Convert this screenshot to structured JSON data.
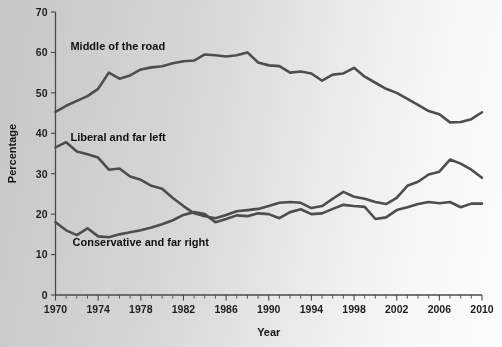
{
  "chart_data": {
    "type": "line",
    "title": "",
    "xlabel": "Year",
    "ylabel": "Percentage",
    "xlim": [
      1970,
      2010
    ],
    "ylim": [
      0,
      70
    ],
    "grid": false,
    "legend_position": "inline-annotations",
    "x_ticks_major": [
      1970,
      1974,
      1978,
      1982,
      1986,
      1990,
      1994,
      1998,
      2002,
      2006,
      2010
    ],
    "x_tick_labels": [
      "1970",
      "1974",
      "1978",
      "1982",
      "1986",
      "1990",
      "1994",
      "1998",
      "2002",
      "2006",
      "2010"
    ],
    "x_minor_tick_step": 1,
    "y_ticks": [
      0,
      10,
      20,
      30,
      40,
      50,
      60,
      70
    ],
    "y_tick_labels": [
      "0",
      "10",
      "20",
      "30",
      "40",
      "50",
      "60",
      "70"
    ],
    "x": [
      1970,
      1971,
      1972,
      1973,
      1974,
      1975,
      1976,
      1977,
      1978,
      1979,
      1980,
      1981,
      1982,
      1983,
      1984,
      1985,
      1986,
      1987,
      1988,
      1989,
      1990,
      1991,
      1992,
      1993,
      1994,
      1995,
      1996,
      1997,
      1998,
      1999,
      2000,
      2001,
      2002,
      2003,
      2004,
      2005,
      2006,
      2007,
      2008,
      2009,
      2010
    ],
    "series": [
      {
        "name": "Middle of the road",
        "label": "Middle of the road",
        "color": "#4e4e4e",
        "label_x": 1971.4,
        "label_y": 60.5,
        "values": [
          45.3,
          46.8,
          48.0,
          49.2,
          51.0,
          55.0,
          53.5,
          54.3,
          55.8,
          56.3,
          56.6,
          57.3,
          57.8,
          58.0,
          59.5,
          59.3,
          59.0,
          59.3,
          60.0,
          57.5,
          56.8,
          56.6,
          55.0,
          55.3,
          54.8,
          53.0,
          54.5,
          54.8,
          56.2,
          54.0,
          52.5,
          51.0,
          50.0,
          48.5,
          47.0,
          45.5,
          44.7,
          42.7,
          42.8,
          43.5,
          45.2
        ]
      },
      {
        "name": "Liberal and far left",
        "label": "Liberal and far left",
        "color": "#4e4e4e",
        "label_x": 1971.4,
        "label_y": 38.2,
        "values": [
          36.5,
          37.8,
          35.5,
          34.8,
          34.0,
          31.0,
          31.3,
          29.3,
          28.5,
          27.0,
          26.3,
          24.0,
          22.0,
          20.2,
          19.5,
          19.0,
          19.8,
          20.7,
          21.0,
          21.3,
          22.0,
          22.8,
          23.0,
          22.8,
          21.5,
          22.0,
          23.8,
          25.5,
          24.3,
          23.8,
          23.0,
          22.5,
          24.0,
          27.0,
          28.0,
          29.8,
          30.5,
          33.5,
          32.5,
          31.0,
          29.0
        ]
      },
      {
        "name": "Conservative and far right",
        "label": "Conservative and far right",
        "color": "#4e4e4e",
        "label_x": 1971.6,
        "label_y": 12.0,
        "values": [
          18.0,
          16.0,
          14.8,
          16.5,
          14.5,
          14.3,
          15.0,
          15.5,
          16.0,
          16.7,
          17.5,
          18.5,
          19.8,
          20.5,
          20.0,
          18.0,
          18.8,
          19.7,
          19.5,
          20.2,
          20.0,
          19.0,
          20.5,
          21.2,
          20.0,
          20.2,
          21.3,
          22.3,
          22.0,
          21.8,
          18.8,
          19.2,
          21.0,
          21.7,
          22.5,
          23.0,
          22.7,
          23.0,
          21.7,
          22.6,
          22.6
        ]
      }
    ]
  }
}
